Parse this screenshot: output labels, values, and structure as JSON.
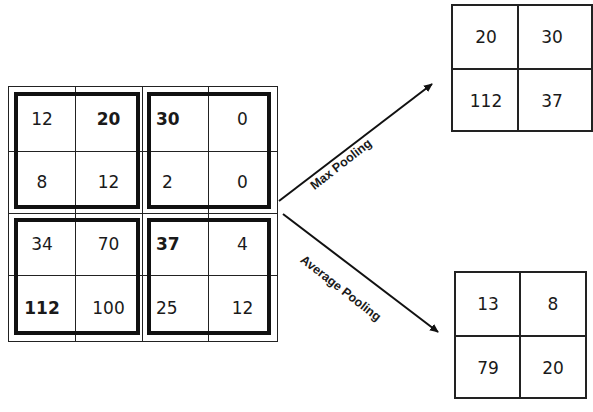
{
  "input_matrix": {
    "rows": [
      [
        "12",
        "20",
        "30",
        "0"
      ],
      [
        "8",
        "12",
        "2",
        "0"
      ],
      [
        "34",
        "70",
        "37",
        "4"
      ],
      [
        "112",
        "100",
        "25",
        "12"
      ]
    ],
    "bold_cells": [
      [
        0,
        1
      ],
      [
        0,
        2
      ],
      [
        2,
        2
      ],
      [
        3,
        0
      ]
    ]
  },
  "max_pooling": {
    "label": "Max Pooling",
    "rows": [
      [
        "20",
        "30"
      ],
      [
        "112",
        "37"
      ]
    ]
  },
  "average_pooling": {
    "label": "Average Pooling",
    "rows": [
      [
        "13",
        "8"
      ],
      [
        "79",
        "20"
      ]
    ]
  }
}
